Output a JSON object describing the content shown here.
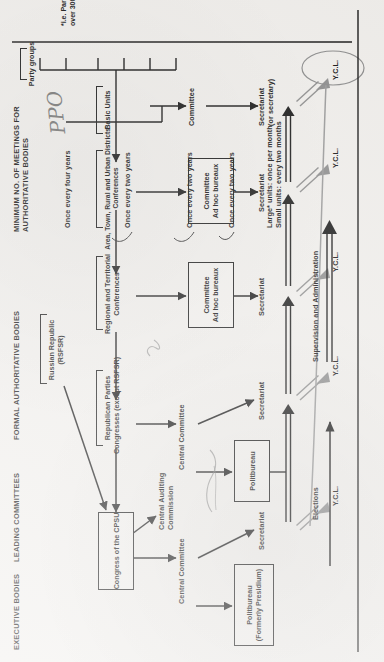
{
  "document": {
    "title": "Structure of the Communist Party of the Soviet Union",
    "orientation": "landscape-diagram-rotated-90-ccw",
    "background_color": "#f1efec",
    "ink_color": "#1b1b1b"
  },
  "column_headers": [
    {
      "id": "executive-bodies",
      "label": "EXECUTIVE BODIES"
    },
    {
      "id": "leading-committees",
      "label": "LEADING COMMITTEES"
    },
    {
      "id": "formal-authoritative",
      "label": "FORMAL AUTHORITATIVE BODIES"
    },
    {
      "id": "minimum-meetings",
      "label": "MINIMUM NO. OF MEETINGS FOR\nAUTHORITATIVE BODIES"
    }
  ],
  "boxes": [
    {
      "id": "congress-cpsu",
      "label": "Congress of the CPSU"
    },
    {
      "id": "politbureau",
      "label": "Politbureau\n(Formerly Presidium)"
    },
    {
      "id": "politbureau-2",
      "label": "Politbureau"
    },
    {
      "id": "committee-adhoc-1",
      "label": "Committee\nAd hoc bureaux"
    },
    {
      "id": "committee-adhoc-2",
      "label": "Committee\nAd hoc bureaux"
    }
  ],
  "bracket_labels": [
    {
      "id": "republican-parties",
      "label": "Republican Parties\nCongresses (except RSFSR)"
    },
    {
      "id": "russian-republic",
      "label": "Russian Republic\n(RSFSR)"
    },
    {
      "id": "regional-territorial",
      "label": "Regional and Territorial\nConferences"
    },
    {
      "id": "area-town-rural",
      "label": "Area, Town, Rural and Urban Districts'\nConferences"
    },
    {
      "id": "basic-units",
      "label": "Basic Units"
    },
    {
      "id": "party-groups",
      "label": "Party groups"
    }
  ],
  "plain_labels": [
    {
      "id": "central-auditing-commission",
      "label": "Central Auditing\nCommission"
    },
    {
      "id": "central-committee-1",
      "label": "Central Committee"
    },
    {
      "id": "central-committee-2",
      "label": "Central Committee"
    },
    {
      "id": "committee-1",
      "label": "Committee"
    },
    {
      "id": "committee-2",
      "label": "Committee"
    }
  ],
  "secretariats": [
    {
      "id": "secretariat-1",
      "label": "Secretariat"
    },
    {
      "id": "secretariat-2",
      "label": "Secretariat"
    },
    {
      "id": "secretariat-3",
      "label": "Secretariat"
    },
    {
      "id": "secretariat-4",
      "label": "Secretariat"
    },
    {
      "id": "secretariat-5",
      "label": "Secretariat\n(or secretary)"
    }
  ],
  "ycl_nodes": [
    {
      "id": "ycl-1",
      "label": "Y.C.L."
    },
    {
      "id": "ycl-2",
      "label": "Y.C.L."
    },
    {
      "id": "ycl-3",
      "label": "Y.C.L."
    },
    {
      "id": "ycl-4",
      "label": "Y.C.L."
    },
    {
      "id": "ycl-5",
      "label": "Y.C.L.",
      "circled": true
    }
  ],
  "meeting_frequencies": [
    {
      "id": "freq-congress",
      "label": "Once every four years"
    },
    {
      "id": "freq-republican",
      "label": "Once every two years"
    },
    {
      "id": "freq-regional",
      "label": "Once every two years"
    },
    {
      "id": "freq-area",
      "label": "Once every two years"
    },
    {
      "id": "freq-basic",
      "label": "Large* units: once per month\nSmall units: every two months"
    }
  ],
  "footnote": {
    "id": "footnote-asterisk",
    "label": "*i.e. Party organisations\nover 300 strong"
  },
  "legend": [
    {
      "id": "legend-elections",
      "label": "Elections",
      "arrow": "single-line-arrow"
    },
    {
      "id": "legend-supervision",
      "label": "Supervision and Administration",
      "arrow": "double-line-arrow"
    }
  ],
  "annotations": [
    {
      "id": "handwriting-ppo",
      "label": "PPO"
    },
    {
      "id": "handwriting-squiggle-1",
      "label": ""
    },
    {
      "id": "handwriting-squiggle-2",
      "label": ""
    }
  ]
}
